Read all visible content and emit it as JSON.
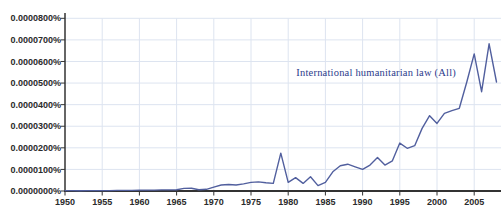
{
  "chart_data": {
    "type": "line",
    "title": "",
    "legend_label": "International humanitarian law (All)",
    "xlabel": "",
    "ylabel": "",
    "values_unit": "percent × 1e-7 (y axis shows 0.0000000% to 0.0000800%)",
    "years": [
      1950,
      1951,
      1952,
      1953,
      1954,
      1955,
      1956,
      1957,
      1958,
      1959,
      1960,
      1961,
      1962,
      1963,
      1964,
      1965,
      1966,
      1967,
      1968,
      1969,
      1970,
      1971,
      1972,
      1973,
      1974,
      1975,
      1976,
      1977,
      1978,
      1979,
      1980,
      1981,
      1982,
      1983,
      1984,
      1985,
      1986,
      1987,
      1988,
      1989,
      1990,
      1991,
      1992,
      1993,
      1994,
      1995,
      1996,
      1997,
      1998,
      1999,
      2000,
      2001,
      2002,
      2003,
      2004,
      2005,
      2006,
      2007,
      2008
    ],
    "values": [
      2,
      2,
      1,
      2,
      2,
      2,
      2,
      3,
      3,
      3,
      4,
      4,
      4,
      5,
      5,
      6,
      12,
      13,
      6,
      8,
      18,
      28,
      30,
      28,
      33,
      40,
      42,
      38,
      35,
      175,
      40,
      62,
      35,
      66,
      25,
      40,
      89,
      117,
      124,
      112,
      100,
      120,
      155,
      120,
      140,
      222,
      198,
      210,
      290,
      349,
      313,
      360,
      372,
      383,
      505,
      635,
      460,
      682,
      505
    ],
    "xlim": [
      1950,
      2008.6
    ],
    "ylim": [
      0,
      800
    ],
    "grid": true,
    "legend_position": "inline-right",
    "x_ticks_years": [
      1950,
      1955,
      1960,
      1965,
      1970,
      1975,
      1980,
      1985,
      1990,
      1995,
      2000,
      2005
    ],
    "x_tick_labels": [
      "1950",
      "1955",
      "1960",
      "1965",
      "1970",
      "1975",
      "1980",
      "1985",
      "1990",
      "1995",
      "2000",
      "2005"
    ],
    "y_tick_labels": [
      "0.0000800%",
      "0.0000700%",
      "0.0000600%",
      "0.0000500%",
      "0.0000400%",
      "0.0000300%",
      "0.0000200%",
      "0.0000100%",
      "0.0000000%"
    ],
    "colors": {
      "background": "#ffffff",
      "grid": "#dde4f0",
      "axis": "#333333",
      "tick_label": "#2b2b2b",
      "line": "#515f9e",
      "legend_text": "#2c3b8c"
    }
  }
}
